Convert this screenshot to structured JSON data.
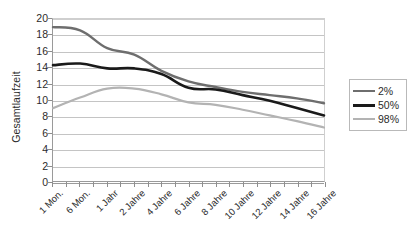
{
  "chart_data": {
    "type": "line",
    "title": "",
    "xlabel": "",
    "ylabel": "Gesamtlaufzeit",
    "ylim": [
      0,
      20
    ],
    "ytick_step": 2,
    "yticks": [
      0,
      2,
      4,
      6,
      8,
      10,
      12,
      14,
      16,
      18,
      20
    ],
    "ytick_labels": [
      "0",
      "2",
      "4",
      "6",
      "8",
      "10",
      "12",
      "14",
      "16",
      "18",
      "20"
    ],
    "grid": "horizontal",
    "legend_position": "right",
    "x_minor_ticks": 21,
    "categories": [
      "1 Mon.",
      "6 Mon.",
      "1 Jahr",
      "2 Jahre",
      "4 Jahre",
      "6 Jahre",
      "8 Jahre",
      "10 Jahre",
      "12 Jahre",
      "14 Jahre",
      "16 Jahre"
    ],
    "series": [
      {
        "name": "2%",
        "color": "#6e6e6e",
        "width": 2.4,
        "values": [
          19.0,
          18.6,
          16.4,
          15.6,
          13.6,
          12.3,
          11.6,
          11.0,
          10.6,
          10.2,
          9.6
        ]
      },
      {
        "name": "50%",
        "color": "#1a1a1a",
        "width": 2.6,
        "values": [
          14.3,
          14.5,
          13.9,
          13.9,
          13.2,
          11.5,
          11.3,
          10.6,
          9.9,
          9.0,
          8.1
        ]
      },
      {
        "name": "98%",
        "color": "#b3b3b3",
        "width": 2.2,
        "values": [
          9.0,
          10.3,
          11.4,
          11.4,
          10.7,
          9.7,
          9.4,
          8.8,
          8.1,
          7.4,
          6.6
        ]
      }
    ]
  },
  "legend": {
    "items": [
      {
        "label": "2%"
      },
      {
        "label": "50%"
      },
      {
        "label": "98%"
      }
    ]
  },
  "colors": {
    "axis": "#9a9a9a",
    "grid": "#c4c4c4",
    "text": "#2b2b2b",
    "background": "#ffffff"
  }
}
